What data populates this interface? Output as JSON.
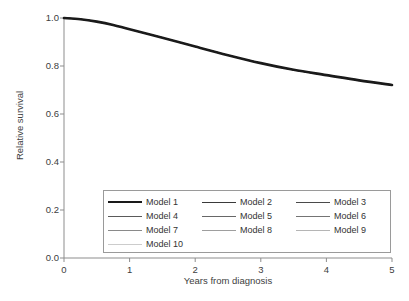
{
  "chart_data": {
    "type": "line",
    "title": "",
    "xlabel": "Years from diagnosis",
    "ylabel": "Relative survival",
    "xlim": [
      0,
      5
    ],
    "ylim": [
      0,
      1
    ],
    "xticks": [
      "0",
      "1",
      "2",
      "3",
      "4",
      "5"
    ],
    "yticks": [
      "0.0",
      "0.2",
      "0.4",
      "0.6",
      "0.8",
      "1.0"
    ],
    "grid": false,
    "legend_position": "inside-bottom-center",
    "x": [
      0,
      0.25,
      0.5,
      0.75,
      1,
      1.5,
      2,
      2.5,
      3,
      3.5,
      4,
      4.5,
      5
    ],
    "series": [
      {
        "name": "Model 1",
        "color": "#1a1a1a",
        "width": 2.6,
        "values": [
          1.0,
          0.995,
          0.985,
          0.971,
          0.953,
          0.918,
          0.881,
          0.845,
          0.812,
          0.784,
          0.762,
          0.74,
          0.721
        ]
      },
      {
        "name": "Model 2",
        "color": "#3a3a3a",
        "width": 1.1,
        "values": [
          1.0,
          0.995,
          0.985,
          0.971,
          0.953,
          0.918,
          0.881,
          0.845,
          0.812,
          0.784,
          0.762,
          0.74,
          0.721
        ]
      },
      {
        "name": "Model 3",
        "color": "#4a4a4a",
        "width": 1.0,
        "values": [
          1.0,
          0.995,
          0.985,
          0.971,
          0.953,
          0.918,
          0.881,
          0.845,
          0.812,
          0.784,
          0.762,
          0.74,
          0.721
        ]
      },
      {
        "name": "Model 4",
        "color": "#5a5a5a",
        "width": 1.0,
        "values": [
          1.0,
          0.995,
          0.985,
          0.971,
          0.953,
          0.918,
          0.881,
          0.845,
          0.812,
          0.784,
          0.762,
          0.74,
          0.721
        ]
      },
      {
        "name": "Model 5",
        "color": "#676767",
        "width": 1.0,
        "values": [
          1.0,
          0.995,
          0.985,
          0.971,
          0.953,
          0.918,
          0.881,
          0.845,
          0.812,
          0.784,
          0.762,
          0.74,
          0.721
        ]
      },
      {
        "name": "Model 6",
        "color": "#747474",
        "width": 1.0,
        "values": [
          1.0,
          0.995,
          0.985,
          0.971,
          0.953,
          0.918,
          0.881,
          0.845,
          0.812,
          0.784,
          0.762,
          0.74,
          0.721
        ]
      },
      {
        "name": "Model 7",
        "color": "#8a8a8a",
        "width": 1.0,
        "values": [
          1.0,
          0.995,
          0.985,
          0.971,
          0.953,
          0.918,
          0.881,
          0.845,
          0.812,
          0.784,
          0.762,
          0.74,
          0.721
        ]
      },
      {
        "name": "Model 8",
        "color": "#9e9e9e",
        "width": 1.0,
        "values": [
          1.0,
          0.995,
          0.985,
          0.971,
          0.953,
          0.918,
          0.881,
          0.845,
          0.812,
          0.784,
          0.762,
          0.74,
          0.721
        ]
      },
      {
        "name": "Model 9",
        "color": "#b5b5b5",
        "width": 1.0,
        "values": [
          1.0,
          0.995,
          0.985,
          0.971,
          0.953,
          0.918,
          0.881,
          0.845,
          0.812,
          0.784,
          0.762,
          0.74,
          0.721
        ]
      },
      {
        "name": "Model 10",
        "color": "#cccccc",
        "width": 1.0,
        "values": [
          1.0,
          0.995,
          0.985,
          0.971,
          0.953,
          0.918,
          0.881,
          0.845,
          0.812,
          0.784,
          0.762,
          0.74,
          0.721
        ]
      }
    ]
  },
  "axis": {
    "color": "#8d8d8d"
  },
  "legend": {
    "border_color": "#9a9a9a",
    "entries": [
      {
        "label": "Model 1"
      },
      {
        "label": "Model 2"
      },
      {
        "label": "Model 3"
      },
      {
        "label": "Model 4"
      },
      {
        "label": "Model 5"
      },
      {
        "label": "Model 6"
      },
      {
        "label": "Model 7"
      },
      {
        "label": "Model 8"
      },
      {
        "label": "Model 9"
      },
      {
        "label": "Model 10"
      }
    ]
  }
}
